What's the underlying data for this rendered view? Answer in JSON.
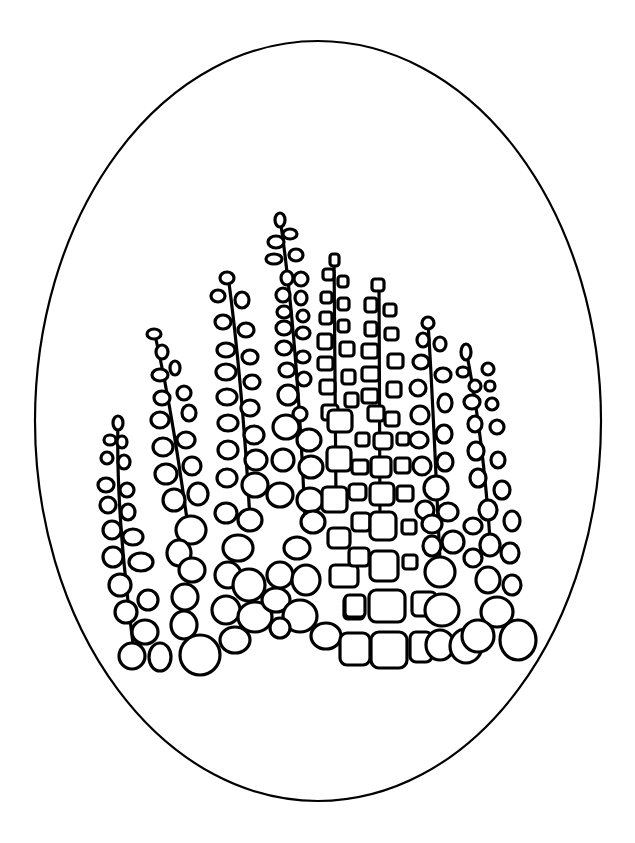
{
  "artwork": {
    "title": "Coloring page: hollyhock stalks in an oval frame",
    "background": "#ffffff",
    "line_color": "#000000",
    "frame": {
      "shape": "ellipse",
      "cx": 318,
      "cy": 421,
      "rx": 283,
      "ry": 380
    },
    "stalks": [
      {
        "name": "stalk-1",
        "x": 115,
        "top": 418,
        "bottom": 660,
        "bud": "oval"
      },
      {
        "name": "stalk-2",
        "x": 165,
        "top": 333,
        "bottom": 660,
        "bud": "oval"
      },
      {
        "name": "stalk-3",
        "x": 232,
        "top": 272,
        "bottom": 650,
        "bud": "oval"
      },
      {
        "name": "stalk-4",
        "x": 292,
        "top": 213,
        "bottom": 640,
        "bud": "oval"
      },
      {
        "name": "stalk-5",
        "x": 335,
        "top": 255,
        "bottom": 660,
        "bud": "rounded-square"
      },
      {
        "name": "stalk-6",
        "x": 380,
        "top": 280,
        "bottom": 665,
        "bud": "rounded-square"
      },
      {
        "name": "stalk-7",
        "x": 432,
        "top": 318,
        "bottom": 655,
        "bud": "oval"
      },
      {
        "name": "stalk-8",
        "x": 478,
        "top": 347,
        "bottom": 660,
        "bud": "oval"
      }
    ]
  }
}
